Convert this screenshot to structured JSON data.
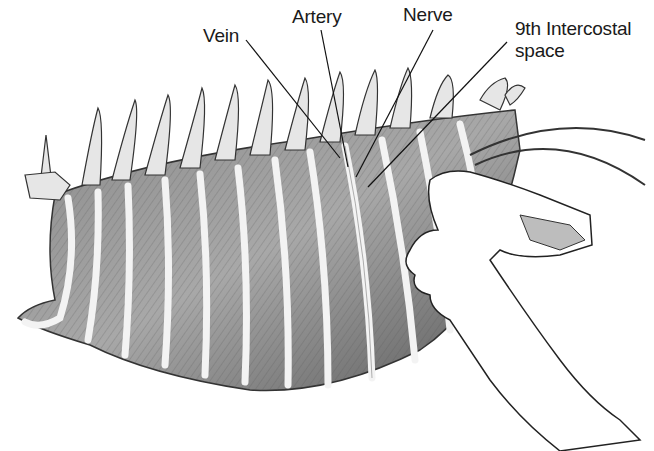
{
  "figure": {
    "background": "#ffffff",
    "ink_color": "#1a1a1a"
  },
  "labels": [
    {
      "id": "vein",
      "text": "Vein",
      "x": 203,
      "y": 25,
      "leader": {
        "x1": 246,
        "y1": 40,
        "x2": 340,
        "y2": 158
      }
    },
    {
      "id": "artery",
      "text": "Artery",
      "x": 292,
      "y": 6,
      "leader": {
        "x1": 321,
        "y1": 30,
        "x2": 348,
        "y2": 167
      }
    },
    {
      "id": "nerve",
      "text": "Nerve",
      "x": 403,
      "y": 4,
      "leader": {
        "x1": 433,
        "y1": 30,
        "x2": 356,
        "y2": 177
      }
    },
    {
      "id": "intercostal",
      "text": "9th Intercostal",
      "text2": "space",
      "x": 515,
      "y": 18,
      "leader": {
        "x1": 507,
        "y1": 42,
        "x2": 368,
        "y2": 187
      }
    }
  ]
}
